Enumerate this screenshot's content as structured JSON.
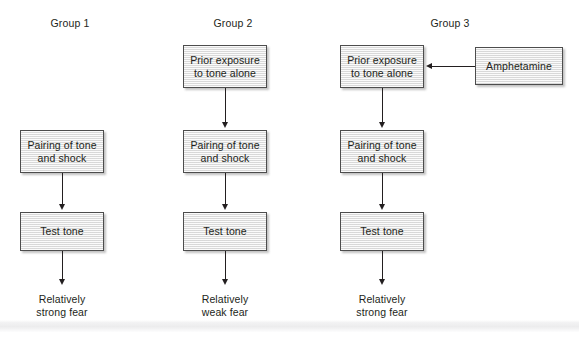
{
  "figure": {
    "title": "",
    "columns": [
      {
        "id": "group-1",
        "label": "Group 1",
        "label_x": 70,
        "label_y": 22,
        "box_x": 20,
        "boxes": [
          {
            "id": "pairing",
            "text": "Pairing of tone\nand shock",
            "y": 130,
            "h": 43
          },
          {
            "id": "test-tone",
            "text": "Test tone",
            "y": 212,
            "h": 39
          }
        ],
        "outcome": {
          "text": "Relatively\nstrong fear",
          "y": 293
        }
      },
      {
        "id": "group-2",
        "label": "Group 2",
        "label_x": 233,
        "label_y": 22,
        "box_x": 183,
        "boxes": [
          {
            "id": "prior-exposure",
            "text": "Prior exposure\nto tone alone",
            "y": 45,
            "h": 43
          },
          {
            "id": "pairing",
            "text": "Pairing of tone\nand shock",
            "y": 130,
            "h": 43
          },
          {
            "id": "test-tone",
            "text": "Test tone",
            "y": 212,
            "h": 39
          }
        ],
        "outcome": {
          "text": "Relatively\nweak fear",
          "y": 293
        }
      },
      {
        "id": "group-3",
        "label": "Group 3",
        "label_x": 450,
        "label_y": 22,
        "box_x": 340,
        "boxes": [
          {
            "id": "prior-exposure",
            "text": "Prior exposure\nto tone alone",
            "y": 45,
            "h": 43
          },
          {
            "id": "pairing",
            "text": "Pairing of tone\nand shock",
            "y": 130,
            "h": 43
          },
          {
            "id": "test-tone",
            "text": "Test tone",
            "y": 212,
            "h": 39
          }
        ],
        "outcome": {
          "text": "Relatively\nstrong fear",
          "y": 293
        }
      }
    ],
    "side_box": {
      "id": "amphetamine",
      "text": "Amphetamine",
      "x": 475,
      "y": 47,
      "w": 88,
      "h": 38
    },
    "box_width": 84,
    "colors": {
      "box_fill": "#e3e3e3",
      "box_border": "#4d4d4d",
      "text": "#231f20",
      "connector": "#231f20",
      "background": "#ffffff",
      "band": "#ececed"
    }
  }
}
